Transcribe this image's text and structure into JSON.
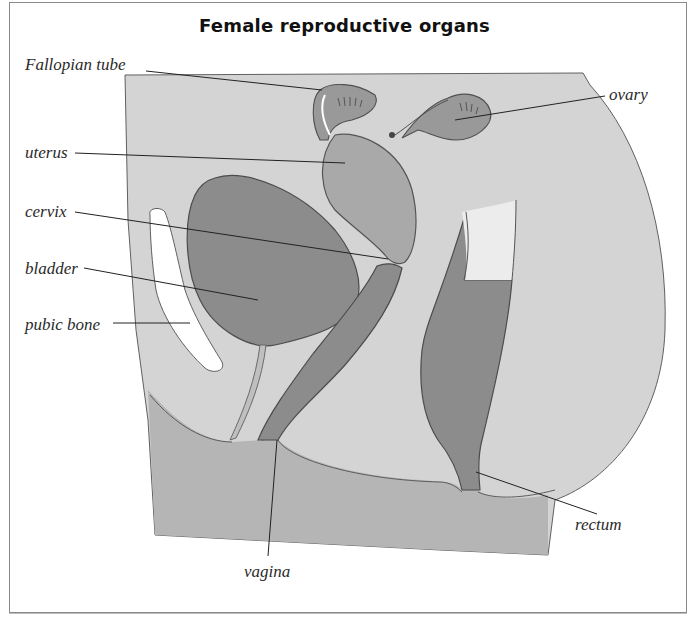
{
  "title": "Female reproductive organs",
  "labels": {
    "fallopian_tube": "Fallopian tube",
    "ovary": "ovary",
    "uterus": "uterus",
    "cervix": "cervix",
    "bladder": "bladder",
    "pubic_bone": "pubic bone",
    "rectum": "rectum",
    "vagina": "vagina"
  },
  "colors": {
    "body_fill": "#d4d4d4",
    "organ_dark": "#8c8c8c",
    "organ_mid": "#a9a9a9",
    "floor": "#b5b5b5",
    "outline": "#555555",
    "leader": "#222222",
    "bone": "#ffffff"
  }
}
